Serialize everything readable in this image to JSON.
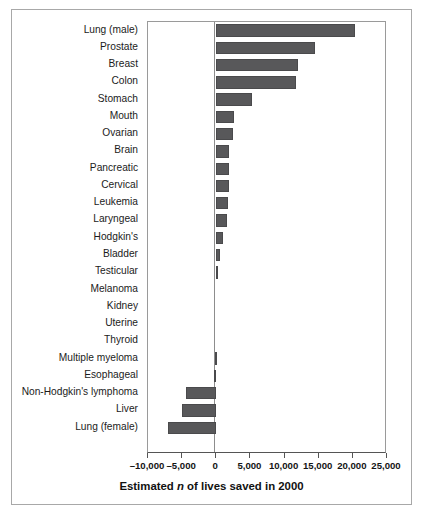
{
  "chart_data": {
    "type": "bar",
    "orientation": "horizontal",
    "title": "",
    "xlabel": "Estimated n of lives saved in 2000",
    "ylabel": "",
    "xlim": [
      -10000,
      25000
    ],
    "xticks": [
      -10000,
      -5000,
      0,
      5000,
      10000,
      15000,
      20000,
      25000
    ],
    "xticklabels": [
      "–10,000",
      "–5,000",
      "0",
      "5,000",
      "10,000",
      "15,000",
      "20,000",
      "25,000"
    ],
    "grid": false,
    "legend": null,
    "bar_color": "#58585a",
    "categories": [
      "Lung (male)",
      "Prostate",
      "Breast",
      "Colon",
      "Stomach",
      "Mouth",
      "Ovarian",
      "Brain",
      "Pancreatic",
      "Cervical",
      "Leukemia",
      "Laryngeal",
      "Hodgkin's",
      "Bladder",
      "Testicular",
      "Melanoma",
      "Kidney",
      "Uterine",
      "Thyroid",
      "Multiple myeloma",
      "Esophageal",
      "Non-Hodgkin's lymphoma",
      "Liver",
      "Lung (female)"
    ],
    "values": [
      20300,
      14400,
      12000,
      11700,
      5200,
      2600,
      2400,
      1900,
      1800,
      1800,
      1700,
      1500,
      1000,
      600,
      300,
      0,
      0,
      0,
      0,
      -200,
      -300,
      -4500,
      -5000,
      -7000
    ]
  },
  "axis": {
    "x_title_prefix": "Estimated ",
    "x_title_italic": "n",
    "x_title_suffix": " of lives saved in 2000"
  }
}
